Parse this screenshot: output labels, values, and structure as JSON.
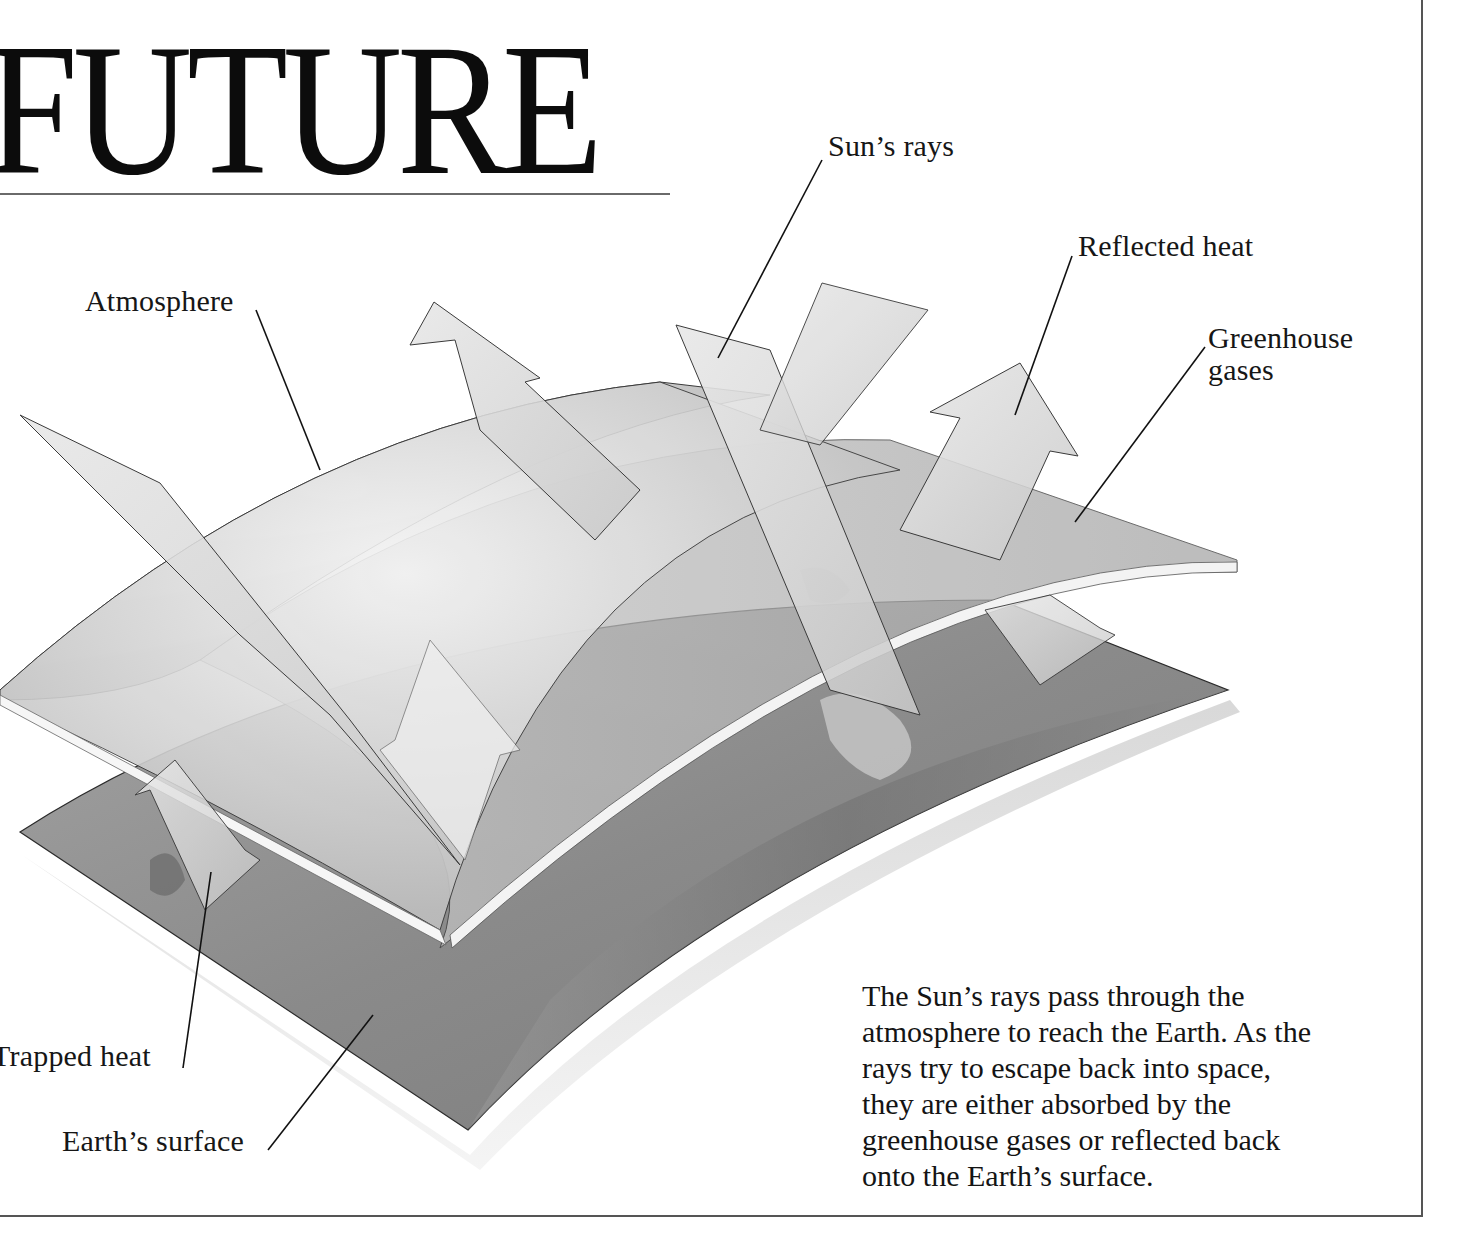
{
  "header": {
    "title": "FUTURE"
  },
  "diagram": {
    "labels": {
      "sun_rays": "Sun’s rays",
      "reflected_heat": "Reflected heat",
      "atmosphere": "Atmosphere",
      "greenhouse_gases_line1": "Greenhouse",
      "greenhouse_gases_line2": "gases",
      "trapped_heat": "Trapped heat",
      "earths_surface": "Earth’s surface"
    },
    "layers": [
      "Atmosphere",
      "Greenhouse gases",
      "Earth’s surface"
    ],
    "arrows": [
      "Sun’s rays",
      "Reflected heat",
      "Trapped heat"
    ],
    "colors": {
      "ink": "#111111",
      "atmosphere_layer": "#d4d4d4",
      "earth_layer": "#8e8e8e",
      "arrow_fill": "#dedede",
      "rule": "#555555"
    }
  },
  "caption": {
    "lines": [
      "The Sun’s rays pass through the",
      "atmosphere to reach the Earth. As the",
      "rays try to escape back into space,",
      "they are either absorbed by the",
      "greenhouse gases or reflected back",
      "onto the Earth’s surface."
    ]
  }
}
